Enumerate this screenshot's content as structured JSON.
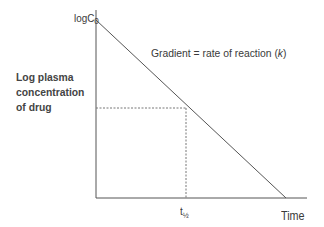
{
  "diagram": {
    "y_axis_label": "Log plasma concentration of drug",
    "y_label_lines": [
      "Log plasma",
      "concentration",
      "of drug"
    ],
    "y_intercept_label": "logC",
    "y_intercept_subscript": "0",
    "line_annotation": "Gradient = rate of reaction (",
    "line_annotation_k": "k",
    "line_annotation_end": ")",
    "x_axis_label": "Time",
    "half_life_label": "t",
    "half_life_subscript": "½",
    "colors": {
      "axis": "#555555",
      "line": "#555555",
      "dashed": "#777777",
      "text": "#3a3a3a"
    }
  }
}
